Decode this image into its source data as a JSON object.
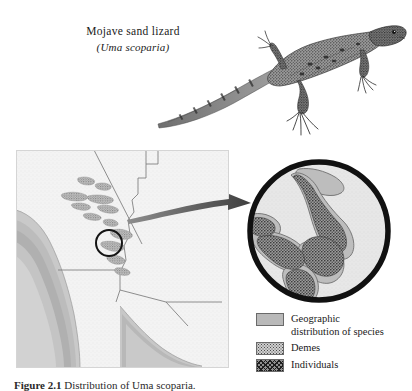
{
  "figure": {
    "lizard_common_name": "Mojave sand lizard",
    "lizard_scientific_name": "(Uma scoparia)",
    "caption_number": "Figure 2.1",
    "caption_text": "Distribution of Uma scoparia."
  },
  "legend": {
    "items": [
      {
        "label_line1": "Geographic",
        "label_line2": "distribution of species",
        "swatch": "solid-gray-swatch",
        "color": "#b9b9b9"
      },
      {
        "label_line1": "Demes",
        "label_line2": "",
        "swatch": "stippled-swatch",
        "color": "#cfcfcf"
      },
      {
        "label_line1": "Individuals",
        "label_line2": "",
        "swatch": "dense-hatched-swatch",
        "color": "#8e8e8e"
      }
    ]
  },
  "map": {
    "region_description": "Southwestern United States, Mojave Desert region",
    "background_color": "#f2f2f2",
    "ocean_color": "#b4b4b4",
    "marker_label": "",
    "state_line_color": "#6f6f6f"
  },
  "inset": {
    "ring_color": "#111111",
    "field_color": "#e6e6e6",
    "deme_color": "#b0b0b0",
    "individual_color": "#555555"
  },
  "arrow": {
    "color": "#4d4d4d"
  }
}
